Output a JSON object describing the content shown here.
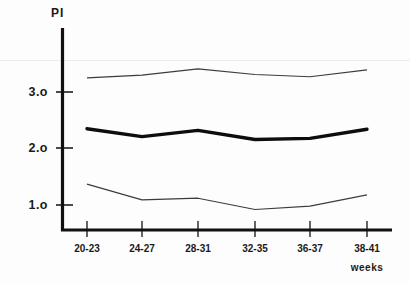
{
  "chart_data": {
    "type": "line",
    "title": "",
    "subtitle": "",
    "ylabel": "PI",
    "xlabel": "weeks",
    "categories": [
      "20-23",
      "24-27",
      "28-31",
      "32-35",
      "36-37",
      "38-41"
    ],
    "ytick_labels": [
      "1.o",
      "2.o",
      "3.o"
    ],
    "ytick_values": [
      1.0,
      2.0,
      3.0
    ],
    "ylim": [
      0.35,
      3.75
    ],
    "grid": false,
    "legend": "none",
    "series": [
      {
        "name": "upper",
        "style": "thin",
        "color": "#3c3c3c",
        "values": [
          3.25,
          3.3,
          3.41,
          3.31,
          3.27,
          3.39
        ]
      },
      {
        "name": "median",
        "style": "thick",
        "color": "#0d0d0d",
        "values": [
          2.35,
          2.21,
          2.32,
          2.16,
          2.18,
          2.34
        ]
      },
      {
        "name": "lower",
        "style": "thin",
        "color": "#3c3c3c",
        "values": [
          1.37,
          1.09,
          1.12,
          0.92,
          0.98,
          1.18
        ]
      }
    ]
  },
  "axis": {
    "y_title": "PI",
    "x_unit": "weeks",
    "ytick_1": "1.o",
    "ytick_2": "2.o",
    "ytick_3": "3.o",
    "xtick_1": "20-23",
    "xtick_2": "24-27",
    "xtick_3": "28-31",
    "xtick_4": "32-35",
    "xtick_5": "36-37",
    "xtick_6": "38-41"
  },
  "colors": {
    "axis": "#111111",
    "thick_line": "#0d0d0d",
    "thin_line": "#3c3c3c",
    "background": "#fdfdfd",
    "text": "#1a1a1a"
  }
}
